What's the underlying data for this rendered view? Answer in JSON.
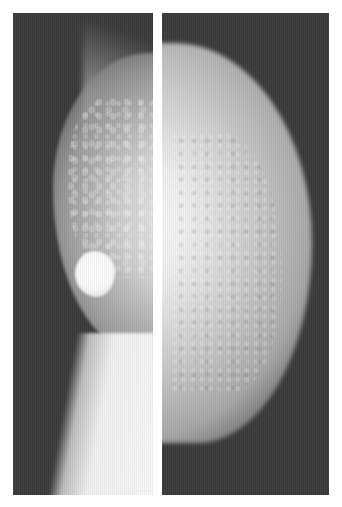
{
  "image": {
    "description": "Two side-by-side grayscale mammogram panels separated by a white vertical divider",
    "panels": [
      {
        "id": "left",
        "view": "oblique view with dense round mass in lower breast"
      },
      {
        "id": "right",
        "view": "craniocaudal-style view of breast tissue"
      }
    ],
    "colors": {
      "background": "#ffffff",
      "film": "#3a3a3a",
      "tissue_bright": "#f4f4f4"
    }
  }
}
